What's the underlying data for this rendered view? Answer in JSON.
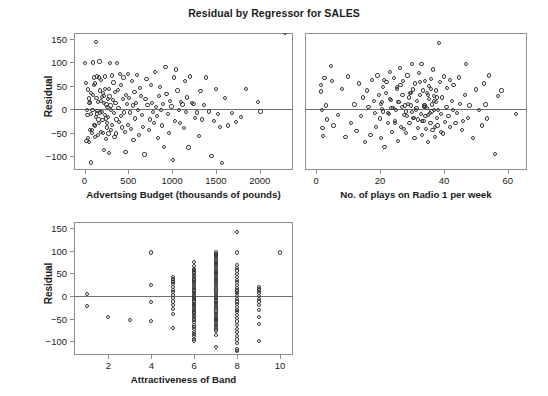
{
  "figure": {
    "title": "Residual by Regressor for SALES",
    "marker_color": "#3a3a3a",
    "frame_color": "#8d8d8d",
    "zeroline_color": "#6f6f6f",
    "background": "#ffffff"
  },
  "chart_data": [
    {
      "type": "scatter",
      "name": "residual-vs-advertising",
      "title": "Residual by Regressor for SALES",
      "xlabel": "Advertsing Budget (thousands of pounds)",
      "ylabel": "Residual",
      "xlim": [
        -120,
        2380
      ],
      "ylim": [
        -130,
        163
      ],
      "xticks": [
        0,
        500,
        1000,
        1500,
        2000
      ],
      "yticks": [
        -100,
        -50,
        0,
        50,
        100,
        150
      ],
      "grid": false,
      "legend": null,
      "reference_line_y": 0,
      "x": [
        10,
        14,
        22,
        30,
        34,
        40,
        44,
        48,
        52,
        58,
        62,
        66,
        70,
        74,
        78,
        84,
        88,
        92,
        96,
        100,
        104,
        108,
        112,
        116,
        120,
        124,
        128,
        132,
        136,
        140,
        144,
        148,
        152,
        156,
        160,
        164,
        168,
        172,
        176,
        180,
        184,
        188,
        192,
        196,
        200,
        206,
        210,
        214,
        218,
        222,
        226,
        230,
        234,
        238,
        242,
        246,
        250,
        254,
        258,
        262,
        266,
        270,
        274,
        278,
        282,
        286,
        290,
        296,
        300,
        306,
        312,
        318,
        324,
        330,
        336,
        342,
        348,
        354,
        360,
        366,
        372,
        380,
        388,
        396,
        404,
        412,
        420,
        428,
        436,
        444,
        452,
        460,
        468,
        476,
        484,
        492,
        500,
        510,
        520,
        530,
        540,
        550,
        560,
        570,
        580,
        590,
        600,
        612,
        624,
        636,
        648,
        660,
        672,
        684,
        696,
        708,
        720,
        732,
        744,
        756,
        768,
        780,
        792,
        804,
        816,
        828,
        840,
        852,
        864,
        876,
        888,
        900,
        912,
        924,
        936,
        950,
        964,
        978,
        992,
        1006,
        1020,
        1034,
        1048,
        1062,
        1076,
        1090,
        1104,
        1118,
        1132,
        1146,
        1160,
        1174,
        1188,
        1205,
        1225,
        1245,
        1265,
        1285,
        1305,
        1325,
        1345,
        1365,
        1390,
        1420,
        1450,
        1480,
        1500,
        1520,
        1545,
        1570,
        1600,
        1640,
        1680,
        1730,
        1790,
        1840,
        1980,
        2010,
        2290
      ],
      "y": [
        99,
        56,
        -68,
        -1,
        -12,
        -62,
        42,
        23,
        -70,
        13,
        16,
        -45,
        -10,
        -114,
        35,
        -50,
        -44,
        -1,
        30,
        100,
        -33,
        68,
        51,
        -35,
        55,
        -60,
        144,
        -16,
        24,
        -9,
        70,
        -4,
        -56,
        15,
        -22,
        68,
        -30,
        102,
        -7,
        40,
        62,
        18,
        -48,
        26,
        -6,
        -23,
        34,
        -50,
        14,
        -87,
        29,
        -12,
        70,
        44,
        -20,
        -63,
        10,
        -39,
        -30,
        5,
        22,
        -16,
        -52,
        44,
        -94,
        27,
        99,
        8,
        -2,
        -45,
        72,
        -33,
        19,
        57,
        -8,
        -60,
        36,
        14,
        -52,
        -22,
        99,
        41,
        3,
        -28,
        76,
        -15,
        52,
        -39,
        22,
        68,
        -7,
        -48,
        -91,
        30,
        12,
        -33,
        75,
        24,
        -7,
        -42,
        60,
        8,
        -65,
        37,
        -20,
        14,
        73,
        -2,
        -56,
        46,
        28,
        -12,
        -38,
        -97,
        21,
        65,
        9,
        -44,
        -22,
        52,
        13,
        -6,
        -30,
        79,
        4,
        -15,
        -62,
        28,
        47,
        -1,
        -35,
        12,
        -80,
        90,
        33,
        -10,
        -51,
        18,
        6,
        -109,
        68,
        -25,
        85,
        40,
        -2,
        -30,
        16,
        10,
        -41,
        60,
        -6,
        25,
        -82,
        70,
        13,
        11,
        -18,
        -7,
        -58,
        39,
        -22,
        9,
        68,
        -5,
        -100,
        -25,
        43,
        -11,
        -38,
        -115,
        24,
        -35,
        -8,
        -28,
        -17,
        44,
        15,
        -5
      ]
    },
    {
      "type": "scatter",
      "name": "residual-vs-radio-plays",
      "title": "Residual by Regressor for SALES",
      "xlabel": "No. of plays on Radio 1 per week",
      "ylabel": "Residual",
      "xlim": [
        -3.5,
        66
      ],
      "ylim": [
        -130,
        163
      ],
      "xticks": [
        0,
        20,
        40,
        60
      ],
      "yticks": [
        -100,
        -50,
        0,
        50,
        100,
        150
      ],
      "grid": false,
      "legend": null,
      "reference_line_y": 0,
      "x": [
        1.5,
        1.6,
        1.8,
        2.0,
        2.2,
        2.6,
        3.0,
        3.4,
        4.6,
        5.0,
        5.4,
        6.8,
        8.0,
        9.2,
        10.0,
        11.0,
        12.0,
        12.6,
        13.4,
        14.0,
        14.6,
        15.2,
        15.8,
        16.4,
        17.0,
        17.6,
        18.0,
        18.4,
        18.8,
        19.2,
        19.6,
        20.0,
        20.2,
        20.4,
        20.8,
        21.0,
        21.4,
        21.8,
        22.0,
        22.4,
        22.8,
        23.0,
        23.4,
        23.8,
        24.0,
        24.4,
        24.8,
        25.0,
        25.2,
        25.6,
        26.0,
        26.2,
        26.6,
        27.0,
        27.2,
        27.6,
        28.0,
        28.2,
        28.6,
        29.0,
        29.2,
        29.6,
        30.0,
        30.2,
        30.4,
        30.8,
        31.0,
        31.2,
        31.6,
        32.0,
        32.2,
        32.4,
        32.8,
        33.0,
        33.2,
        33.4,
        33.6,
        33.8,
        34.0,
        34.2,
        34.4,
        34.6,
        34.8,
        35.0,
        35.2,
        35.4,
        35.6,
        35.8,
        36.0,
        36.2,
        36.4,
        36.6,
        36.8,
        37.0,
        37.2,
        37.4,
        37.6,
        37.8,
        38.0,
        38.4,
        38.8,
        39.0,
        39.4,
        39.8,
        40.0,
        40.4,
        40.8,
        41.0,
        41.4,
        41.8,
        42.0,
        42.4,
        42.8,
        43.0,
        43.6,
        44.0,
        44.6,
        45.0,
        45.6,
        46.0,
        46.6,
        47.0,
        47.6,
        48.0,
        49.0,
        50.0,
        51.0,
        52.0,
        52.6,
        53.0,
        53.4,
        54.0,
        56.0,
        57.0,
        58.0,
        62.5,
        20.5,
        21.2,
        22.6,
        23.2,
        24.6,
        25.4,
        26.8,
        27.4,
        28.8,
        29.4,
        30.6,
        31.4,
        32.6,
        33.1,
        34.1,
        34.9,
        35.1,
        35.9,
        36.1,
        36.9,
        37.1,
        37.9,
        38.2,
        39.2,
        25.8,
        26.4,
        27.8,
        28.4,
        29.8,
        31.8,
        20.6,
        23.6,
        30.1,
        33.9
      ],
      "y": [
        52,
        38,
        -2,
        -40,
        -58,
        66,
        8,
        -22,
        93,
        60,
        -35,
        -12,
        44,
        -60,
        70,
        -30,
        10,
        -46,
        55,
        -15,
        25,
        -70,
        40,
        5,
        -55,
        62,
        18,
        -8,
        -38,
        72,
        30,
        -20,
        -62,
        12,
        48,
        -5,
        -80,
        35,
        58,
        -30,
        -10,
        80,
        20,
        -48,
        2,
        66,
        -25,
        -1,
        44,
        -68,
        15,
        88,
        -38,
        30,
        60,
        -12,
        -5,
        -50,
        72,
        25,
        -30,
        8,
        96,
        -18,
        42,
        -62,
        55,
        -2,
        18,
        -40,
        78,
        30,
        -10,
        96,
        -55,
        40,
        -25,
        8,
        60,
        -15,
        -42,
        35,
        2,
        -70,
        50,
        22,
        -8,
        -30,
        65,
        10,
        -45,
        85,
        -2,
        28,
        -60,
        15,
        40,
        -18,
        -35,
        142,
        58,
        -10,
        25,
        -52,
        70,
        -28,
        5,
        45,
        -15,
        -38,
        62,
        18,
        -2,
        52,
        -30,
        -8,
        68,
        12,
        -45,
        -25,
        30,
        96,
        -18,
        8,
        -62,
        42,
        -2,
        -35,
        55,
        10,
        -20,
        72,
        -95,
        28,
        40,
        -10,
        15,
        62,
        -8,
        22,
        -30,
        48,
        5,
        -42,
        12,
        35,
        -18,
        2,
        58,
        -25,
        8,
        30,
        -12,
        44,
        -5,
        18,
        -38,
        25,
        -2,
        -48,
        15,
        52,
        8,
        -15,
        35,
        -22,
        0,
        2,
        -6,
        4
      ]
    },
    {
      "type": "scatter",
      "name": "residual-vs-attractiveness",
      "title": "Residual by Regressor for SALES",
      "xlabel": "Attractiveness of Band",
      "ylabel": "Residual",
      "xlim": [
        0.4,
        10.6
      ],
      "ylim": [
        -130,
        163
      ],
      "xticks": [
        2,
        4,
        6,
        8,
        10
      ],
      "yticks": [
        -100,
        -50,
        0,
        50,
        100,
        150
      ],
      "grid": false,
      "legend": null,
      "reference_line_y": 0,
      "x": [
        1,
        1,
        2,
        3,
        4,
        4,
        4,
        4,
        5,
        5,
        5,
        5,
        5,
        5,
        5,
        5,
        5,
        5,
        5,
        5,
        5,
        5,
        5,
        6,
        6,
        6,
        6,
        6,
        6,
        6,
        6,
        6,
        6,
        6,
        6,
        6,
        6,
        6,
        6,
        6,
        6,
        6,
        6,
        6,
        6,
        6,
        6,
        6,
        6,
        6,
        6,
        6,
        6,
        6,
        6,
        6,
        6,
        6,
        6,
        6,
        6,
        6,
        6,
        6,
        6,
        6,
        6,
        6,
        6,
        7,
        7,
        7,
        7,
        7,
        7,
        7,
        7,
        7,
        7,
        7,
        7,
        7,
        7,
        7,
        7,
        7,
        7,
        7,
        7,
        7,
        7,
        7,
        7,
        7,
        7,
        7,
        7,
        7,
        7,
        7,
        7,
        7,
        7,
        7,
        7,
        7,
        7,
        7,
        7,
        7,
        7,
        7,
        7,
        7,
        7,
        7,
        7,
        7,
        7,
        7,
        7,
        8,
        8,
        8,
        8,
        8,
        8,
        8,
        8,
        8,
        8,
        8,
        8,
        8,
        8,
        8,
        8,
        8,
        8,
        8,
        8,
        8,
        8,
        8,
        8,
        8,
        8,
        8,
        8,
        8,
        8,
        8,
        8,
        8,
        9,
        9,
        9,
        9,
        9,
        9,
        9,
        9,
        9,
        9,
        9,
        9,
        10
      ],
      "y": [
        5,
        -22,
        -46,
        -52,
        96,
        25,
        -14,
        -55,
        42,
        38,
        34,
        30,
        26,
        20,
        14,
        8,
        2,
        -5,
        -12,
        -20,
        -28,
        -40,
        -70,
        74,
        66,
        60,
        54,
        50,
        46,
        42,
        38,
        34,
        30,
        26,
        22,
        18,
        14,
        10,
        6,
        2,
        -2,
        -6,
        -10,
        -14,
        -18,
        -22,
        -26,
        -30,
        -34,
        -38,
        -42,
        -46,
        -50,
        -58,
        -65,
        -72,
        -80,
        -88,
        -94,
        -98,
        58,
        36,
        12,
        -4,
        -20,
        -36,
        -52,
        -68,
        -84,
        96,
        92,
        88,
        84,
        80,
        76,
        72,
        68,
        64,
        60,
        56,
        52,
        48,
        44,
        40,
        36,
        32,
        28,
        24,
        20,
        16,
        12,
        8,
        4,
        0,
        -4,
        -8,
        -12,
        -16,
        -20,
        -24,
        -28,
        -32,
        -36,
        -40,
        -44,
        -48,
        -52,
        -56,
        -60,
        -64,
        -68,
        -72,
        -76,
        -86,
        -112,
        70,
        30,
        -10,
        -50,
        90,
        50,
        10,
        -30,
        141,
        96,
        68,
        62,
        56,
        48,
        42,
        36,
        30,
        24,
        18,
        12,
        6,
        0,
        -6,
        -12,
        -18,
        -24,
        -30,
        -36,
        -42,
        -48,
        -56,
        -64,
        -72,
        -80,
        -88,
        -96,
        -104,
        -118,
        -122,
        20,
        16,
        12,
        6,
        0,
        -6,
        -12,
        -20,
        -30,
        -46,
        -62,
        -100,
        96
      ]
    }
  ],
  "panels": [
    {
      "name": "panel-advertising",
      "chart_index": 0
    },
    {
      "name": "panel-radio-plays",
      "chart_index": 1
    },
    {
      "name": "panel-attractiveness",
      "chart_index": 2
    }
  ]
}
